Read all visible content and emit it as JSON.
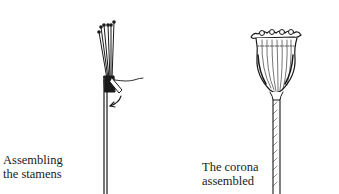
{
  "figures": [
    {
      "id": "stamens",
      "caption_line1": "Assembling",
      "caption_line2": "the stamens",
      "description": "Wire stem with bundle of stamens bound by thread, arrow indicating wrapping direction"
    },
    {
      "id": "corona",
      "caption_line1": "The corona",
      "caption_line2": "assembled",
      "description": "Poppy seed head corona assembled on a wrapped stem"
    }
  ],
  "colors": {
    "ink": "#1a1a1a",
    "background": "#ffffff"
  }
}
